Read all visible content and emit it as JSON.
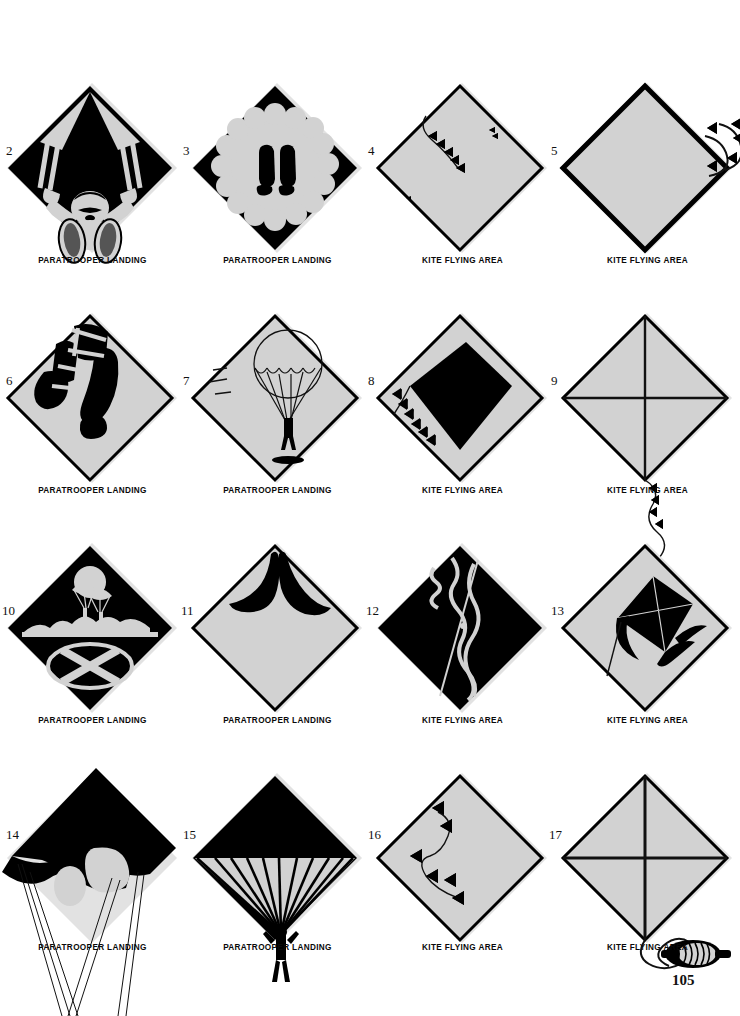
{
  "page": {
    "page_number": "105",
    "colors": {
      "sign_fill": "#d2d2d2",
      "sign_shadow": "#e2e2e2",
      "ink": "#000000",
      "paper": "#ffffff"
    }
  },
  "captions": {
    "paratrooper": "PARATROOPER LANDING",
    "kite": "KITE FLYING AREA"
  },
  "figures": [
    {
      "number": "2",
      "caption": "PARATROOPER LANDING",
      "icon": "paratrooper-child-canopy-icon",
      "description": "Black diamond with child paratrooper gripping risers, canopy overhead",
      "row": 1,
      "col": 1
    },
    {
      "number": "3",
      "caption": "PARATROOPER LANDING",
      "icon": "canopy-scalloped-with-boots-icon",
      "description": "Black diamond with scalloped white canopy and two boot prints",
      "row": 1,
      "col": 2
    },
    {
      "number": "4",
      "caption": "KITE FLYING AREA",
      "icon": "kite-string-bowties-icon",
      "description": "Grey diamond with thin black border and diagonal string of bowtie tail marks",
      "row": 1,
      "col": 3
    },
    {
      "number": "5",
      "caption": "KITE FLYING AREA",
      "icon": "kite-tail-overflow-icon",
      "description": "Grey diamond with heavy black border; bowtie tail curls off the right corner",
      "row": 1,
      "col": 4
    },
    {
      "number": "6",
      "caption": "PARATROOPER LANDING",
      "icon": "paratrooper-legs-harness-icon",
      "description": "Grey diamond, black legs with harness straps and jump boots",
      "row": 2,
      "col": 1
    },
    {
      "number": "7",
      "caption": "PARATROOPER LANDING",
      "icon": "parachutist-descending-icon",
      "description": "Grey diamond, line-drawn round canopy with jumper and ground shadow",
      "row": 2,
      "col": 2
    },
    {
      "number": "8",
      "caption": "KITE FLYING AREA",
      "icon": "black-kite-with-tail-icon",
      "description": "Grey diamond with solid black kite and bowtie tail at lower left",
      "row": 2,
      "col": 3
    },
    {
      "number": "9",
      "caption": "KITE FLYING AREA",
      "icon": "kite-frame-with-string-icon",
      "description": "Grey diamond as kite with spars; bowtie tail trails off bottom corner",
      "row": 2,
      "col": 4
    },
    {
      "number": "10",
      "caption": "PARATROOPER LANDING",
      "icon": "parachutists-over-landing-zone-icon",
      "description": "Black diamond, parachutists above horizon over circled X drop zone",
      "row": 3,
      "col": 1
    },
    {
      "number": "11",
      "caption": "PARATROOPER LANDING",
      "icon": "boots-silhouette-icon",
      "description": "Grey diamond with two black boot silhouettes at the top corner",
      "row": 3,
      "col": 2
    },
    {
      "number": "12",
      "caption": "KITE FLYING AREA",
      "icon": "kite-string-night-icon",
      "description": "Black diamond with pale ragged kite string and tail running diagonally",
      "row": 3,
      "col": 3
    },
    {
      "number": "13",
      "caption": "KITE FLYING AREA",
      "icon": "kite-with-streamers-icon",
      "description": "Grey diamond with black kite and trailing ribbon streamers",
      "row": 3,
      "col": 4
    },
    {
      "number": "14",
      "caption": "PARATROOPER LANDING",
      "icon": "ram-air-canopy-icon",
      "description": "Large black canopy overflowing the diamond with long suspension lines",
      "row": 4,
      "col": 1
    },
    {
      "number": "15",
      "caption": "PARATROOPER LANDING",
      "icon": "round-canopy-gores-icon",
      "description": "Black diamond canopy with gore lines converging to a jumper below",
      "row": 4,
      "col": 2
    },
    {
      "number": "16",
      "caption": "KITE FLYING AREA",
      "icon": "bowtie-tail-trail-icon",
      "description": "Grey diamond with curving string of bowtie tail knots",
      "row": 4,
      "col": 3
    },
    {
      "number": "17",
      "caption": "KITE FLYING AREA",
      "icon": "kite-with-spool-icon",
      "description": "Grey diamond kite with spars; string leads to a wound reel at lower right",
      "row": 4,
      "col": 4
    }
  ]
}
